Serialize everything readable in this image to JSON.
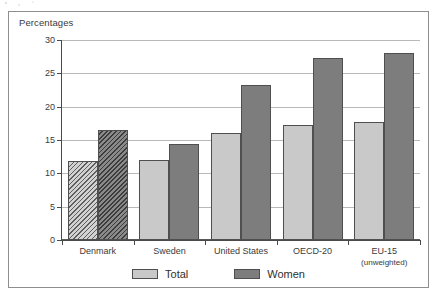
{
  "figure": {
    "y_axis_caption": "Percentages"
  },
  "legend": {
    "items": [
      {
        "label": "Total",
        "color": "#c9c9c9",
        "name": "legend-total"
      },
      {
        "label": "Women",
        "color": "#7d7d7d",
        "name": "legend-women"
      }
    ]
  },
  "chart_data": {
    "type": "bar",
    "title": "",
    "subtitle": "",
    "xlabel": "",
    "ylabel": "Percentages",
    "ylim": [
      0,
      30
    ],
    "ytick_labels": [
      "0",
      "5",
      "10",
      "15",
      "20",
      "25",
      "30"
    ],
    "yticks": [
      0,
      5,
      10,
      15,
      20,
      25,
      30
    ],
    "grid": true,
    "legend_position": "bottom-center",
    "categories": [
      "Denmark",
      "Sweden",
      "United States",
      "OECD-20",
      "EU-15"
    ],
    "category_sublabels": [
      "",
      "",
      "",
      "",
      "(unweighted)"
    ],
    "series": [
      {
        "name": "Total",
        "color": "#c9c9c9",
        "values": [
          11.9,
          12.0,
          16.0,
          17.2,
          17.7
        ]
      },
      {
        "name": "Women",
        "color": "#7d7d7d",
        "values": [
          16.5,
          14.4,
          23.2,
          27.3,
          28.1
        ]
      }
    ],
    "hatched_categories": [
      "Denmark"
    ],
    "annotations": []
  }
}
